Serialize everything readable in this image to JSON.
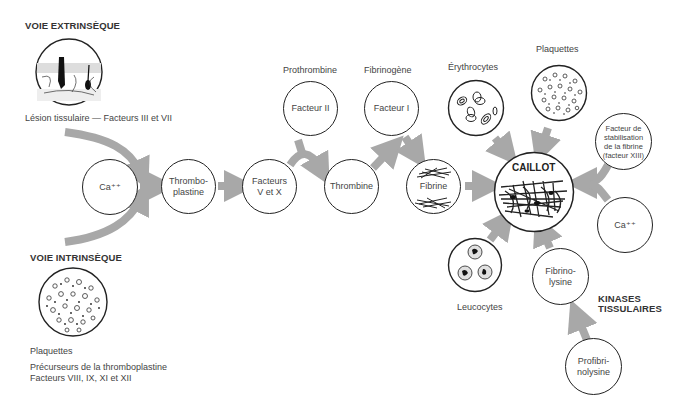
{
  "extrinsic": {
    "title": "VOIE EXTRINSÈQUE",
    "caption": "Lésion tissulaire — Facteurs III et VII"
  },
  "intrinsic": {
    "title": "VOIE INTRINSÈQUE",
    "caption1": "Plaquettes",
    "caption2": "Précurseurs de la thromboplastine",
    "caption3": "Facteurs VIII, IX, XI et XII"
  },
  "nodes": {
    "ca1": "Ca⁺⁺",
    "thromboplastine": "Thrombo-\nplastine",
    "facteurs_v_x": "Facteurs\nV et X",
    "facteur_ii": "Facteur II",
    "thrombine": "Thrombine",
    "facteur_i": "Facteur I",
    "fibrine": "Fibrine",
    "caillot": "CAILLOT",
    "facteur_xiii": "Facteur de\nstabilisation\nde la fibrine\n(facteur XIII)",
    "ca2": "Ca⁺⁺",
    "fibrinolysine": "Fibrino-\nlysine",
    "profibrinolysine": "Profibri-\nnolysine"
  },
  "labels": {
    "prothrombine": "Prothrombine",
    "fibrinogene": "Fibrinogène",
    "erythrocytes": "Érythrocytes",
    "plaquettes": "Plaquettes",
    "leucocytes": "Leucocytes",
    "kinases_line1": "KINASES",
    "kinases_line2": "TISSULAIRES"
  },
  "colors": {
    "arrow": "#a8a8a8",
    "outline": "#222222",
    "text": "#444444"
  }
}
